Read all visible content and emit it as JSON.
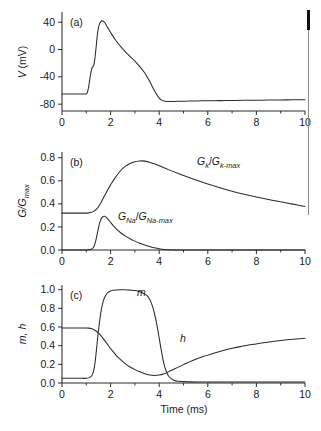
{
  "figure": {
    "xlabel": "Time (ms)",
    "panels": [
      {
        "tag": "(a)",
        "ylabel_italic": "V",
        "ylabel_unit": " (mV)"
      },
      {
        "tag": "(b)",
        "ylabel": "G/Gmax"
      },
      {
        "tag": "(c)",
        "ylabel": "m, h"
      }
    ],
    "curve_labels": {
      "gk": {
        "num_main": "G",
        "num_sub": "k",
        "den_main": "G",
        "den_sub": "k-max"
      },
      "gna": {
        "num_main": "G",
        "num_sub": "Na",
        "den_main": "G",
        "den_sub": "Na-max"
      },
      "m": "m",
      "h": "h"
    },
    "axis_ticks": {
      "x_major": [
        "0",
        "2",
        "4",
        "6",
        "8",
        "10"
      ],
      "y_a": [
        "40",
        "0",
        "-40",
        "-80"
      ],
      "y_b": [
        "0.8",
        "0.6",
        "0.4",
        "0.2",
        "0.0"
      ],
      "y_c": [
        "1.0",
        "0.8",
        "0.6",
        "0.4",
        "0.2",
        "0.0"
      ]
    }
  },
  "chart_data": [
    {
      "type": "line",
      "panel": "(a)",
      "title": "",
      "xlabel": "Time (ms)",
      "ylabel": "V (mV)",
      "xlim": [
        0,
        10
      ],
      "ylim": [
        -90,
        55
      ],
      "yticks": [
        40,
        0,
        -40,
        -80
      ],
      "xticks": [
        0,
        2,
        4,
        6,
        8,
        10
      ],
      "grid": false,
      "series": [
        {
          "name": "V",
          "x": [
            0,
            0.2,
            0.4,
            0.6,
            0.8,
            1.0,
            1.05,
            1.1,
            1.15,
            1.2,
            1.25,
            1.3,
            1.35,
            1.4,
            1.45,
            1.5,
            1.55,
            1.6,
            1.65,
            1.7,
            1.75,
            1.8,
            1.9,
            2.0,
            2.2,
            2.4,
            2.6,
            2.8,
            3.0,
            3.2,
            3.4,
            3.5,
            3.6,
            3.7,
            3.8,
            3.9,
            4.0,
            4.1,
            4.2,
            4.3,
            4.5,
            4.8,
            5.2,
            5.6,
            6.0,
            6.5,
            7.0,
            7.5,
            8.0,
            8.5,
            9.0,
            9.5,
            10.0
          ],
          "y": [
            -65,
            -65,
            -65,
            -65,
            -65,
            -65,
            -62,
            -54,
            -42,
            -32,
            -26,
            -24,
            -14,
            2,
            20,
            32,
            38,
            41,
            42,
            41.5,
            40,
            37,
            31,
            25,
            14,
            5,
            -3,
            -10,
            -17,
            -25,
            -34,
            -40,
            -46,
            -53,
            -60,
            -66,
            -71,
            -74,
            -75.5,
            -76,
            -76,
            -75.8,
            -75.5,
            -75.2,
            -75,
            -74.8,
            -74.6,
            -74.4,
            -74.2,
            -74,
            -73.8,
            -73.6,
            -73.4
          ]
        }
      ]
    },
    {
      "type": "line",
      "panel": "(b)",
      "title": "",
      "xlabel": "Time (ms)",
      "ylabel": "G/Gmax",
      "xlim": [
        0,
        10
      ],
      "ylim": [
        0.0,
        0.85
      ],
      "yticks": [
        0.0,
        0.2,
        0.4,
        0.6,
        0.8
      ],
      "xticks": [
        0,
        2,
        4,
        6,
        8,
        10
      ],
      "grid": false,
      "series": [
        {
          "name": "GK/GK-max",
          "x": [
            0,
            0.4,
            0.8,
            1.0,
            1.1,
            1.2,
            1.3,
            1.4,
            1.5,
            1.6,
            1.7,
            1.8,
            1.9,
            2.0,
            2.2,
            2.4,
            2.6,
            2.8,
            3.0,
            3.2,
            3.3,
            3.4,
            3.6,
            3.8,
            4.0,
            4.4,
            4.8,
            5.2,
            5.6,
            6.0,
            6.5,
            7.0,
            7.5,
            8.0,
            8.5,
            9.0,
            9.5,
            10.0
          ],
          "y": [
            0.32,
            0.32,
            0.32,
            0.32,
            0.322,
            0.327,
            0.335,
            0.35,
            0.375,
            0.41,
            0.45,
            0.49,
            0.53,
            0.565,
            0.63,
            0.685,
            0.725,
            0.75,
            0.765,
            0.772,
            0.773,
            0.771,
            0.762,
            0.748,
            0.731,
            0.695,
            0.662,
            0.63,
            0.6,
            0.572,
            0.54,
            0.51,
            0.483,
            0.46,
            0.438,
            0.418,
            0.398,
            0.378
          ]
        },
        {
          "name": "GNa/GNa-max",
          "x": [
            0,
            0.4,
            0.8,
            1.0,
            1.1,
            1.2,
            1.25,
            1.3,
            1.35,
            1.4,
            1.45,
            1.5,
            1.55,
            1.6,
            1.65,
            1.7,
            1.75,
            1.8,
            1.85,
            1.9,
            2.0,
            2.1,
            2.2,
            2.4,
            2.6,
            2.8,
            3.0,
            3.2,
            3.4,
            3.6,
            3.8,
            4.0,
            4.2,
            4.4,
            5.0,
            6.0,
            7.0,
            8.0,
            9.0,
            10.0
          ],
          "y": [
            0.0,
            0.0,
            0.0,
            0.0,
            0.002,
            0.006,
            0.012,
            0.025,
            0.05,
            0.09,
            0.14,
            0.19,
            0.235,
            0.265,
            0.283,
            0.291,
            0.292,
            0.287,
            0.278,
            0.266,
            0.24,
            0.214,
            0.19,
            0.152,
            0.122,
            0.097,
            0.077,
            0.059,
            0.044,
            0.031,
            0.02,
            0.011,
            0.005,
            0.002,
            0.0,
            0.0,
            0.0,
            0.0,
            0.0,
            0.0
          ]
        }
      ]
    },
    {
      "type": "line",
      "panel": "(c)",
      "title": "",
      "xlabel": "Time (ms)",
      "ylabel": "m, h",
      "xlim": [
        0,
        10
      ],
      "ylim": [
        0.0,
        1.05
      ],
      "yticks": [
        0.0,
        0.2,
        0.4,
        0.6,
        0.8,
        1.0
      ],
      "xticks": [
        0,
        2,
        4,
        6,
        8,
        10
      ],
      "grid": false,
      "series": [
        {
          "name": "m",
          "x": [
            0,
            0.4,
            0.8,
            1.0,
            1.1,
            1.2,
            1.25,
            1.3,
            1.35,
            1.4,
            1.45,
            1.5,
            1.6,
            1.7,
            1.8,
            1.9,
            2.0,
            2.1,
            2.2,
            2.4,
            2.6,
            2.8,
            3.0,
            3.2,
            3.4,
            3.5,
            3.6,
            3.7,
            3.8,
            3.9,
            4.0,
            4.1,
            4.2,
            4.3,
            4.4,
            4.6,
            4.8,
            5.2,
            6.0,
            7.0,
            8.0,
            9.0,
            10.0
          ],
          "y": [
            0.05,
            0.05,
            0.05,
            0.05,
            0.055,
            0.07,
            0.09,
            0.13,
            0.2,
            0.31,
            0.44,
            0.56,
            0.76,
            0.88,
            0.94,
            0.97,
            0.985,
            0.993,
            0.997,
            0.999,
            0.998,
            0.995,
            0.99,
            0.978,
            0.955,
            0.935,
            0.9,
            0.84,
            0.75,
            0.63,
            0.48,
            0.33,
            0.2,
            0.12,
            0.07,
            0.03,
            0.018,
            0.012,
            0.01,
            0.01,
            0.01,
            0.01,
            0.01
          ]
        },
        {
          "name": "h",
          "x": [
            0,
            0.4,
            0.8,
            1.0,
            1.1,
            1.2,
            1.3,
            1.4,
            1.5,
            1.6,
            1.7,
            1.8,
            1.9,
            2.0,
            2.2,
            2.4,
            2.6,
            2.8,
            3.0,
            3.2,
            3.4,
            3.6,
            3.8,
            4.0,
            4.2,
            4.4,
            4.6,
            5.0,
            5.4,
            5.8,
            6.2,
            6.6,
            7.0,
            7.4,
            7.8,
            8.2,
            8.6,
            9.0,
            9.4,
            10.0
          ],
          "y": [
            0.59,
            0.59,
            0.59,
            0.59,
            0.588,
            0.583,
            0.573,
            0.557,
            0.535,
            0.507,
            0.475,
            0.44,
            0.405,
            0.37,
            0.305,
            0.252,
            0.208,
            0.172,
            0.143,
            0.12,
            0.1,
            0.085,
            0.08,
            0.085,
            0.1,
            0.122,
            0.148,
            0.197,
            0.243,
            0.283,
            0.315,
            0.345,
            0.372,
            0.393,
            0.412,
            0.428,
            0.443,
            0.455,
            0.466,
            0.48
          ]
        }
      ]
    }
  ]
}
